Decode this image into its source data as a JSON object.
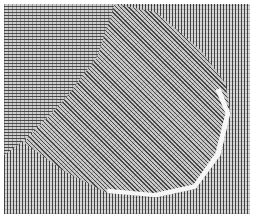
{
  "figure": {
    "regions": [
      {
        "name": "background-vertical-streaks",
        "orientation": "vertical"
      },
      {
        "name": "top-left-horizontal-streaks",
        "orientation": "horizontal"
      },
      {
        "name": "central-blob-diagonal-streaks",
        "orientation": "diagonal"
      }
    ],
    "colors": {
      "background": "#ffffff",
      "streak_dark": "#282828",
      "fill": "#d6d6d6",
      "highlight": "#f6f6f6"
    }
  }
}
